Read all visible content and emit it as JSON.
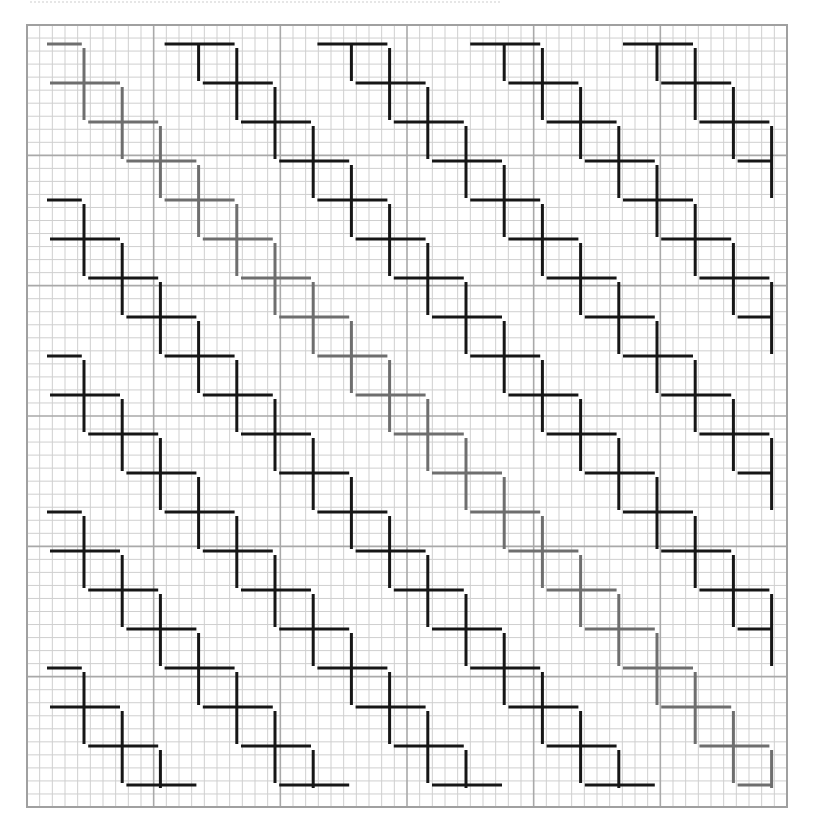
{
  "figure": {
    "grid": {
      "left": 27,
      "top": 25,
      "right": 787,
      "bottom": 807,
      "fine_divisions_x": 60,
      "fine_divisions_y": 60,
      "major_every": 10,
      "minor_color": "#cfcfcf",
      "major_color": "#a9a9a9",
      "border_color": "#a0a0a0"
    },
    "lattice": {
      "origin_h": [
        50,
        83
      ],
      "origin_v": [
        84,
        84
      ],
      "step": [
        38.2,
        39.0
      ],
      "diagonal_offset_x": 152.8,
      "h_length": 70,
      "v_half_up": 36,
      "v_half_down": 36,
      "clip_x": [
        47,
        773
      ],
      "clip_y": [
        43,
        788
      ],
      "stroke_width": 3
    },
    "diagonals": [
      {
        "id": -4,
        "color": "#161616",
        "label": "left-start diagonal 4"
      },
      {
        "id": -3,
        "color": "#161616",
        "label": "left-start diagonal 3"
      },
      {
        "id": -2,
        "color": "#161616",
        "label": "left-start diagonal 2"
      },
      {
        "id": -1,
        "color": "#161616",
        "label": "left-start diagonal 1"
      },
      {
        "id": 0,
        "color": "#6e6e6e",
        "label": "main diagonal (highlighted grey)"
      },
      {
        "id": 1,
        "color": "#161616",
        "label": "top-start diagonal 1"
      },
      {
        "id": 2,
        "color": "#161616",
        "label": "top-start diagonal 2"
      },
      {
        "id": 3,
        "color": "#161616",
        "label": "top-start diagonal 3"
      },
      {
        "id": 4,
        "color": "#161616",
        "label": "top-start diagonal 4"
      }
    ]
  }
}
